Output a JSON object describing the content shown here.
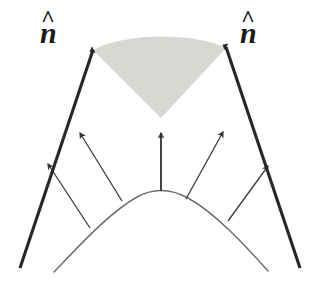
{
  "figure": {
    "background_color": "#ffffff",
    "ink_color": "#2b2b2b",
    "thin_ink_color": "#4a4a4a",
    "surface_color": "#6e6e6e",
    "cone_fill_color": "#d8d8d2",
    "labels": {
      "left_normal": {
        "symbol": "n",
        "accent": "^",
        "full": "n̂"
      },
      "right_normal": {
        "symbol": "n",
        "accent": "^",
        "full": "n̂"
      }
    },
    "elements": {
      "cone_region": "shaded-acceptance-cone",
      "left_ray": "left-normal-ray",
      "right_ray": "right-normal-ray",
      "center_arrow": "center-normal-arrow",
      "surface": "curved-surface-arc",
      "normal_arrows": [
        "outer-left-normal-arrow",
        "inner-left-normal-arrow",
        "center-normal-arrow",
        "inner-right-normal-arrow",
        "outer-right-normal-arrow"
      ]
    },
    "geometry": {
      "apex": {
        "x": 161,
        "y": 118
      },
      "left_arrow_tip": {
        "x": 90,
        "y": 47
      },
      "right_arrow_tip": {
        "x": 229,
        "y": 45
      },
      "surface_apex": {
        "x": 161,
        "y": 191
      },
      "cone_half_angle_deg": 45
    }
  }
}
